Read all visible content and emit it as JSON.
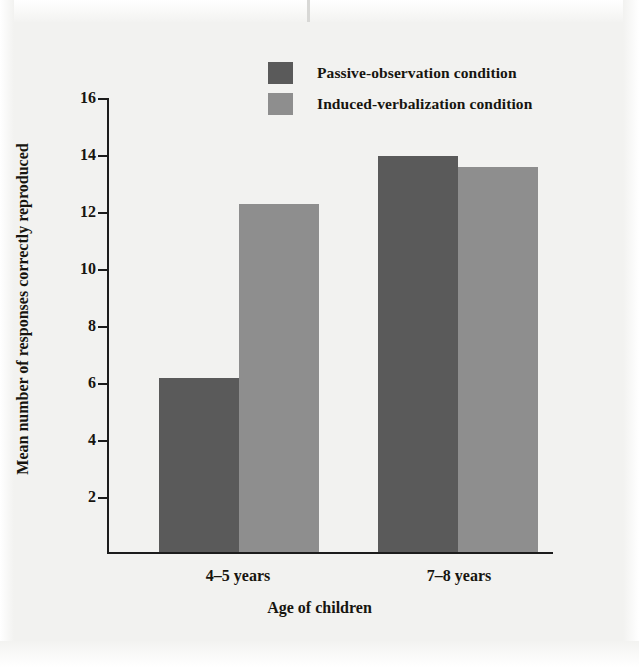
{
  "chart_data": {
    "type": "bar",
    "title": "",
    "xlabel": "Age of children",
    "ylabel": "Mean number of responses correctly reproduced",
    "categories": [
      "4–5 years",
      "7–8 years"
    ],
    "series": [
      {
        "name": "Passive-observation condition",
        "color": "#5a5a5a",
        "values": [
          6.1,
          13.9
        ]
      },
      {
        "name": "Induced-verbalization condition",
        "color": "#8e8e8e",
        "values": [
          12.2,
          13.5
        ]
      }
    ],
    "ylim": [
      0,
      16
    ],
    "yticks": [
      2,
      4,
      6,
      8,
      10,
      12,
      14,
      16
    ],
    "ytick_labels": [
      "2",
      "4",
      "6",
      "8",
      "10",
      "12",
      "14",
      "16"
    ],
    "grid": false,
    "legend_position": "top-center"
  },
  "legend": {
    "items": [
      {
        "label": "Passive-observation condition",
        "color": "#5a5a5a"
      },
      {
        "label": "Induced-verbalization condition",
        "color": "#8e8e8e"
      }
    ]
  },
  "axes": {
    "y_title": "Mean number of responses correctly reproduced",
    "x_title": "Age of children",
    "y_ticks": [
      "16",
      "14",
      "12",
      "10",
      "8",
      "6",
      "4",
      "2"
    ],
    "x_categories": [
      "4–5 years",
      "7–8 years"
    ]
  },
  "colors": {
    "background": "#f2f2f0",
    "ink": "#17150f",
    "axis": "#1c1c1c",
    "series_dark": "#5a5a5a",
    "series_light": "#8e8e8e"
  }
}
